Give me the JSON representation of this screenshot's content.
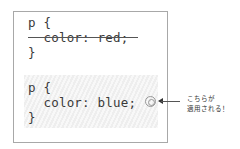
{
  "blocks": [
    {
      "lines": [
        "p {",
        "  color: red;",
        "}"
      ],
      "state": "overridden",
      "strikethrough_line": 1
    },
    {
      "lines": [
        "p {",
        "  color: blue;",
        "}"
      ],
      "state": "applied",
      "highlighted": true
    }
  ],
  "annotation": {
    "marker_icon": "double-circle-icon",
    "arrow_icon": "arrow-left-icon",
    "text_line1": "こちらが",
    "text_line2": "適用される！"
  },
  "colors": {
    "border": "#a8a8a8",
    "text": "#3a3a3a",
    "highlight": "#eeeeee"
  }
}
